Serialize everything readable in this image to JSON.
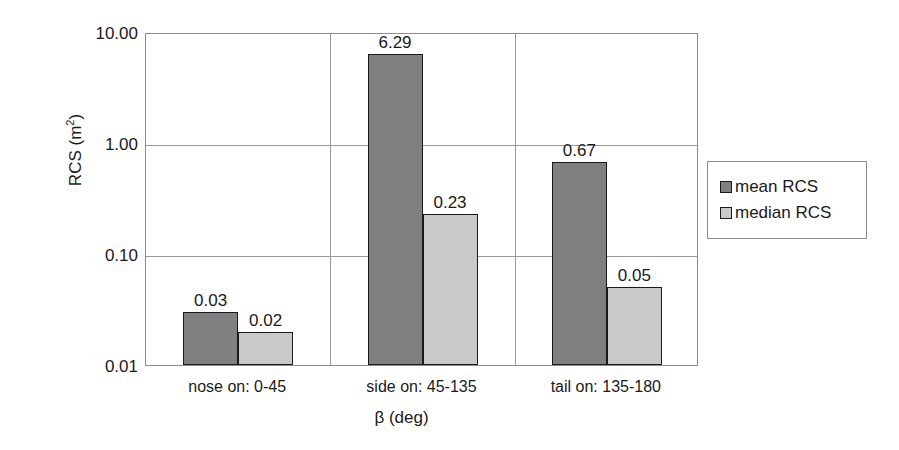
{
  "chart_data": {
    "type": "bar",
    "title": "",
    "xlabel": "β (deg)",
    "ylabel": "RCS (m²)",
    "ylabel_base": "RCS (m",
    "ylabel_sup": "2",
    "ylabel_tail": ")",
    "yscale": "log",
    "ylim": [
      0.01,
      10.0
    ],
    "ytick_labels": [
      "10.00",
      "1.00",
      "0.10",
      "0.01"
    ],
    "ytick_values": [
      10.0,
      1.0,
      0.1,
      0.01
    ],
    "grid": "horizontal-and-category-separators",
    "legend_position": "right",
    "categories": [
      "nose on:  0-45",
      "side on: 45-135",
      "tail on: 135-180"
    ],
    "series": [
      {
        "name": "mean RCS",
        "color": "#808080",
        "values": [
          0.03,
          6.29,
          0.67
        ],
        "labels": [
          "0.03",
          "6.29",
          "0.67"
        ]
      },
      {
        "name": "median RCS",
        "color": "#c9c9c9",
        "values": [
          0.02,
          0.23,
          0.05
        ],
        "labels": [
          "0.02",
          "0.23",
          "0.05"
        ]
      }
    ]
  },
  "legend": {
    "items": [
      {
        "label": "mean RCS",
        "color": "#808080"
      },
      {
        "label": "median RCS",
        "color": "#c9c9c9"
      }
    ]
  },
  "colors": {
    "mean": "#808080",
    "median": "#c9c9c9",
    "outline": "#1a1a1a",
    "grid": "#9a9a9a",
    "frame": "#8c8c8c",
    "background": "#ffffff"
  }
}
